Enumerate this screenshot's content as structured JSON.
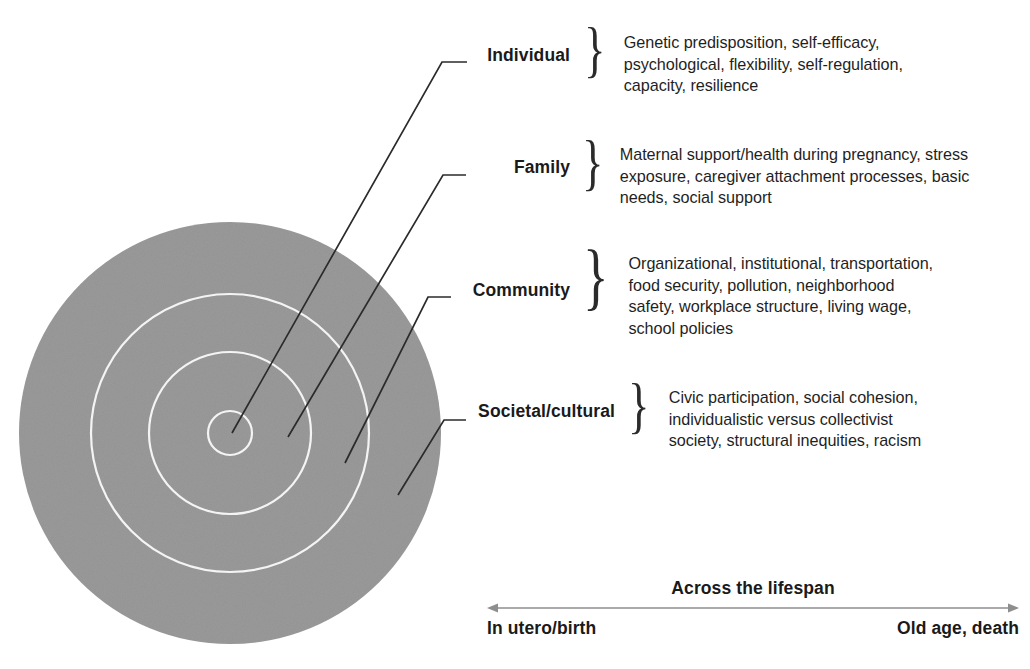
{
  "diagram": {
    "colors": {
      "ring_fill": "#9a9a9a",
      "ring_outline": "#f2f2f2",
      "leader_line": "#2b2b2b",
      "text": "#1a1a1a",
      "background": "#ffffff",
      "axis_line": "#8e8e8e"
    },
    "rings": {
      "center_x": 230,
      "center_y": 433,
      "radii": [
        211,
        139,
        81,
        22
      ],
      "ring_labels": [
        "Societal/cultural",
        "Community",
        "Family",
        "Individual"
      ]
    },
    "levels": [
      {
        "name": "Individual",
        "brace": "}",
        "description_lines": [
          "Genetic predisposition, self-efficacy,",
          "psychological, flexibility, self-regulation,",
          "capacity, resilience"
        ]
      },
      {
        "name": "Family",
        "brace": "}",
        "description_lines": [
          "Maternal support/health during pregnancy, stress",
          "exposure, caregiver attachment processes, basic",
          "needs, social support"
        ]
      },
      {
        "name": "Community",
        "brace": "}",
        "description_lines": [
          "Organizational, institutional, transportation,",
          "food security, pollution, neighborhood",
          "safety, workplace structure, living wage,",
          "school policies"
        ]
      },
      {
        "name": "Societal/cultural",
        "brace": "}",
        "description_lines": [
          "Civic participation, social cohesion,",
          "individualistic versus collectivist",
          "society, structural inequities, racism"
        ]
      }
    ],
    "lifespan": {
      "title": "Across the lifespan",
      "start_label": "In utero/birth",
      "end_label": "Old age, death"
    }
  }
}
